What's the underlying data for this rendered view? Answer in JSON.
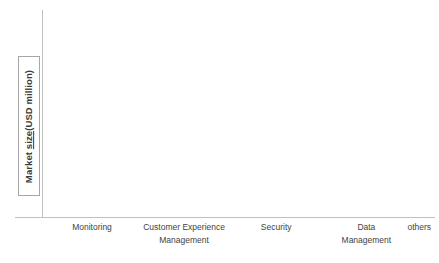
{
  "chart_data": {
    "type": "bar",
    "title": "",
    "subtitle": "",
    "xlabel": "",
    "ylabel": "Market size(USD million)",
    "ylabel_parts": {
      "prefix": "Market ",
      "flagged_word": "size",
      "suffix": "(USD million)"
    },
    "grid": false,
    "legend": "none",
    "ylim": [
      0,
      100
    ],
    "axis_tick_labels": [],
    "categories": [
      "Monitoring",
      "Customer Experience Management",
      "Security",
      "Data Management",
      "others"
    ],
    "category_label_lines": [
      [
        "Monitoring"
      ],
      [
        "Customer Experience",
        "Management"
      ],
      [
        "Security"
      ],
      [
        "Data",
        "Management"
      ],
      [
        "others"
      ]
    ],
    "series": [
      {
        "name": "series-1",
        "values": [
          8,
          7,
          4.5,
          2.5,
          4.5
        ]
      },
      {
        "name": "series-2",
        "values": [
          98,
          57,
          31,
          17,
          22
        ]
      }
    ],
    "bar_color": "#585858",
    "axis_color": "#bfbfbf",
    "label_box_border_color": "#a6a6a6",
    "background": "#ffffff"
  },
  "layout": {
    "groups": [
      {
        "left_pct": 1.5,
        "bar_width_pct": 7.0,
        "label_center_pct": 12.5
      },
      {
        "left_pct": 25.0,
        "bar_width_pct": 7.0,
        "label_center_pct": 36.0
      },
      {
        "left_pct": 48.5,
        "bar_width_pct": 7.0,
        "label_center_pct": 59.5
      },
      {
        "left_pct": 71.5,
        "bar_width_pct": 7.0,
        "label_center_pct": 82.5
      },
      {
        "left_pct": 89.0,
        "bar_width_pct": 7.0,
        "label_center_pct": 96.0
      }
    ]
  }
}
